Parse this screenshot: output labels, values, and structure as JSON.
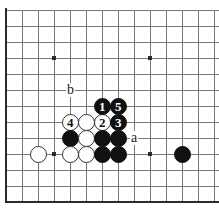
{
  "figure": {
    "kind": "go-board-diagram",
    "background_color": "#ffffff",
    "line_color": "#777777",
    "border_color": "#2b2b2b",
    "black_color": "#111111",
    "white_color": "#ffffff"
  },
  "board": {
    "columns": 14,
    "rows": 13,
    "cell_size": 16,
    "origin_x": 6,
    "origin_y": 10,
    "left_edge_is_border": true,
    "bottom_edge_is_border": true,
    "star_points": [
      {
        "col": 3,
        "row": 3
      },
      {
        "col": 9,
        "row": 3
      },
      {
        "col": 3,
        "row": 9
      },
      {
        "col": 9,
        "row": 9
      }
    ]
  },
  "stones": [
    {
      "id": "stone-white-a1",
      "color": "white",
      "label": "",
      "col": 2,
      "row": 9
    },
    {
      "id": "stone-white-4",
      "color": "white",
      "label": "4",
      "col": 4,
      "row": 7
    },
    {
      "id": "stone-white-b1",
      "color": "white",
      "label": "",
      "col": 5,
      "row": 7
    },
    {
      "id": "stone-white-2",
      "color": "white",
      "label": "2",
      "col": 6,
      "row": 7
    },
    {
      "id": "stone-black-1",
      "color": "black",
      "label": "1",
      "col": 6,
      "row": 6
    },
    {
      "id": "stone-black-5",
      "color": "black",
      "label": "5",
      "col": 7,
      "row": 6
    },
    {
      "id": "stone-black-3",
      "color": "black",
      "label": "3",
      "col": 7,
      "row": 7
    },
    {
      "id": "stone-black-c1",
      "color": "black",
      "label": "",
      "col": 4,
      "row": 8
    },
    {
      "id": "stone-white-c2",
      "color": "white",
      "label": "",
      "col": 5,
      "row": 8
    },
    {
      "id": "stone-black-c3",
      "color": "black",
      "label": "",
      "col": 6,
      "row": 8
    },
    {
      "id": "stone-black-c4",
      "color": "black",
      "label": "",
      "col": 7,
      "row": 8
    },
    {
      "id": "stone-white-d1",
      "color": "white",
      "label": "",
      "col": 4,
      "row": 9
    },
    {
      "id": "stone-white-d2",
      "color": "white",
      "label": "",
      "col": 5,
      "row": 9
    },
    {
      "id": "stone-black-d3",
      "color": "black",
      "label": "",
      "col": 6,
      "row": 9
    },
    {
      "id": "stone-black-d4",
      "color": "black",
      "label": "",
      "col": 7,
      "row": 9
    },
    {
      "id": "stone-black-lone",
      "color": "black",
      "label": "",
      "col": 11,
      "row": 9
    }
  ],
  "point_labels": [
    {
      "id": "point-label-b",
      "text": "b",
      "col": 4,
      "row": 5
    },
    {
      "id": "point-label-a",
      "text": "a",
      "col": 8,
      "row": 8
    }
  ]
}
